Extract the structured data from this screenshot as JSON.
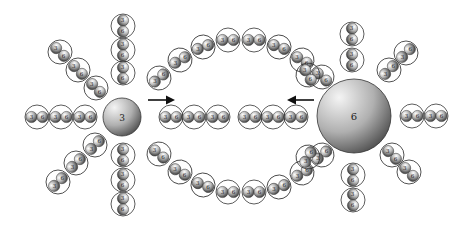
{
  "diagram": {
    "left_core": {
      "label": "3",
      "cx": 122,
      "cy": 117,
      "r": 19
    },
    "right_core": {
      "label": "6",
      "cx": 354,
      "cy": 116,
      "r": 37
    },
    "arrows": [
      {
        "direction": "right",
        "x1": 148,
        "y1": 100,
        "x2": 172,
        "y2": 100
      },
      {
        "direction": "left",
        "x1": 314,
        "y1": 100,
        "x2": 290,
        "y2": 100
      }
    ],
    "pair_labels": [
      "3",
      "6"
    ],
    "clusters": [
      {
        "name": "left-horizontal",
        "pairs": [
          [
            37,
            117,
            0
          ],
          [
            61,
            117,
            0
          ],
          [
            85,
            117,
            0
          ]
        ]
      },
      {
        "name": "left-upper-vertical",
        "pairs": [
          [
            123,
            26,
            90
          ],
          [
            123,
            50,
            90
          ],
          [
            123,
            73,
            90
          ]
        ]
      },
      {
        "name": "left-upper-diagonal",
        "pairs": [
          [
            60,
            52,
            45
          ],
          [
            78,
            70,
            45
          ],
          [
            96,
            88,
            45
          ]
        ]
      },
      {
        "name": "left-lower-diagonal",
        "pairs": [
          [
            58,
            182,
            -45
          ],
          [
            76,
            163,
            -45
          ],
          [
            95,
            145,
            -45
          ]
        ]
      },
      {
        "name": "left-lower-vertical",
        "pairs": [
          [
            123,
            155,
            90
          ],
          [
            123,
            180,
            90
          ],
          [
            123,
            204,
            90
          ]
        ]
      },
      {
        "name": "top-arc",
        "pairs": [
          [
            159,
            78,
            -40
          ],
          [
            180,
            60,
            -30
          ],
          [
            203,
            47,
            -20
          ],
          [
            228,
            40,
            0
          ],
          [
            254,
            40,
            0
          ],
          [
            279,
            47,
            20
          ],
          [
            302,
            60,
            30
          ],
          [
            322,
            77,
            40
          ]
        ]
      },
      {
        "name": "middle-left",
        "pairs": [
          [
            171,
            117,
            0
          ],
          [
            194,
            117,
            0
          ],
          [
            218,
            117,
            0
          ]
        ]
      },
      {
        "name": "middle-right",
        "pairs": [
          [
            250,
            117,
            0
          ],
          [
            273,
            117,
            0
          ],
          [
            296,
            117,
            0
          ]
        ]
      },
      {
        "name": "bottom-arc",
        "pairs": [
          [
            159,
            154,
            40
          ],
          [
            180,
            172,
            30
          ],
          [
            203,
            185,
            20
          ],
          [
            228,
            192,
            0
          ],
          [
            254,
            192,
            0
          ],
          [
            279,
            187,
            -20
          ],
          [
            302,
            173,
            -30
          ],
          [
            322,
            155,
            -40
          ]
        ]
      },
      {
        "name": "right-upper-vertical",
        "pairs": [
          [
            352,
            34,
            90
          ],
          [
            352,
            60,
            90
          ]
        ]
      },
      {
        "name": "right-upper-diagonal",
        "pairs": [
          [
            389,
            70,
            -45
          ],
          [
            406,
            53,
            -45
          ]
        ]
      },
      {
        "name": "right-horizontal",
        "pairs": [
          [
            412,
            116,
            0
          ],
          [
            436,
            116,
            0
          ]
        ]
      },
      {
        "name": "right-lower-diagonal",
        "pairs": [
          [
            392,
            155,
            45
          ],
          [
            409,
            172,
            45
          ]
        ]
      },
      {
        "name": "right-lower-vertical",
        "pairs": [
          [
            353,
            175,
            90
          ],
          [
            353,
            200,
            90
          ]
        ]
      },
      {
        "name": "right-inner-upper",
        "pairs": [
          [
            308,
            75,
            60
          ]
        ]
      },
      {
        "name": "right-inner-lower",
        "pairs": [
          [
            308,
            157,
            -60
          ]
        ]
      }
    ]
  }
}
